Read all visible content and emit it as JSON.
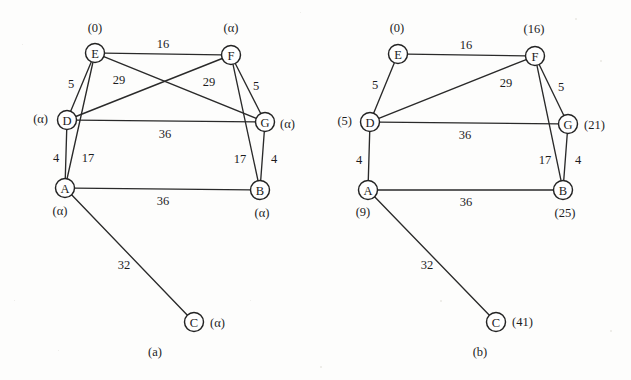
{
  "figure": {
    "type": "graph-diagram",
    "node_radius": 9.5,
    "panels": [
      {
        "id": "panel-a",
        "caption": "(a)",
        "caption_pos": {
          "x": 155,
          "y": 352
        },
        "nodes": [
          {
            "id": "E",
            "label": "E",
            "x": 95,
            "y": 53,
            "dist": "(0)",
            "dist_x": 95,
            "dist_y": 28,
            "dist_anchor": "middle"
          },
          {
            "id": "F",
            "label": "F",
            "x": 231,
            "y": 55,
            "dist": "(α)",
            "dist_x": 231,
            "dist_y": 28,
            "dist_anchor": "middle"
          },
          {
            "id": "D",
            "label": "D",
            "x": 67,
            "y": 120,
            "dist": "(α)",
            "dist_x": 48,
            "dist_y": 119,
            "dist_anchor": "end"
          },
          {
            "id": "G",
            "label": "G",
            "x": 265,
            "y": 122,
            "dist": "(α)",
            "dist_x": 280,
            "dist_y": 124,
            "dist_anchor": "start"
          },
          {
            "id": "A",
            "label": "A",
            "x": 65,
            "y": 188,
            "dist": "(α)",
            "dist_x": 60,
            "dist_y": 211,
            "dist_anchor": "middle"
          },
          {
            "id": "B",
            "label": "B",
            "x": 260,
            "y": 190,
            "dist": "(α)",
            "dist_x": 262,
            "dist_y": 213,
            "dist_anchor": "middle"
          },
          {
            "id": "C",
            "label": "C",
            "x": 194,
            "y": 322,
            "dist": "(α)",
            "dist_x": 210,
            "dist_y": 323,
            "dist_anchor": "start"
          }
        ],
        "edges": [
          {
            "from": "E",
            "to": "F",
            "weight": "16",
            "lx": 163,
            "ly": 44
          },
          {
            "from": "E",
            "to": "D",
            "weight": "5",
            "lx": 71,
            "ly": 84
          },
          {
            "from": "E",
            "to": "G",
            "weight": "29",
            "lx": 119,
            "ly": 80
          },
          {
            "from": "E",
            "to": "A",
            "weight": "17",
            "lx": 88,
            "ly": 158
          },
          {
            "from": "F",
            "to": "D",
            "weight": "29",
            "lx": 209,
            "ly": 82
          },
          {
            "from": "F",
            "to": "G",
            "weight": "5",
            "lx": 256,
            "ly": 86
          },
          {
            "from": "F",
            "to": "B",
            "weight": "17",
            "lx": 240,
            "ly": 159
          },
          {
            "from": "D",
            "to": "G",
            "weight": "36",
            "lx": 165,
            "ly": 134
          },
          {
            "from": "D",
            "to": "A",
            "weight": "4",
            "lx": 56,
            "ly": 158
          },
          {
            "from": "G",
            "to": "B",
            "weight": "4",
            "lx": 274,
            "ly": 159
          },
          {
            "from": "A",
            "to": "B",
            "weight": "36",
            "lx": 163,
            "ly": 201
          },
          {
            "from": "A",
            "to": "C",
            "weight": "32",
            "lx": 124,
            "ly": 265
          }
        ]
      },
      {
        "id": "panel-b",
        "caption": "(b)",
        "caption_pos": {
          "x": 480,
          "y": 352
        },
        "nodes": [
          {
            "id": "E",
            "label": "E",
            "x": 398,
            "y": 54,
            "dist": "(0)",
            "dist_x": 397,
            "dist_y": 28,
            "dist_anchor": "middle"
          },
          {
            "id": "F",
            "label": "F",
            "x": 535,
            "y": 56,
            "dist": "(16)",
            "dist_x": 534,
            "dist_y": 29,
            "dist_anchor": "middle"
          },
          {
            "id": "D",
            "label": "D",
            "x": 370,
            "y": 122,
            "dist": "(5)",
            "dist_x": 352,
            "dist_y": 121,
            "dist_anchor": "end"
          },
          {
            "id": "G",
            "label": "G",
            "x": 568,
            "y": 124,
            "dist": "(21)",
            "dist_x": 584,
            "dist_y": 125,
            "dist_anchor": "start"
          },
          {
            "id": "A",
            "label": "A",
            "x": 368,
            "y": 190,
            "dist": "(9)",
            "dist_x": 363,
            "dist_y": 212,
            "dist_anchor": "middle"
          },
          {
            "id": "B",
            "label": "B",
            "x": 563,
            "y": 190,
            "dist": "(25)",
            "dist_x": 565,
            "dist_y": 213,
            "dist_anchor": "middle"
          },
          {
            "id": "C",
            "label": "C",
            "x": 496,
            "y": 322,
            "dist": "(41)",
            "dist_x": 512,
            "dist_y": 322,
            "dist_anchor": "start"
          }
        ],
        "edges": [
          {
            "from": "E",
            "to": "F",
            "weight": "16",
            "lx": 466,
            "ly": 45
          },
          {
            "from": "E",
            "to": "D",
            "weight": "5",
            "lx": 375,
            "ly": 85
          },
          {
            "from": "F",
            "to": "D",
            "weight": "29",
            "lx": 506,
            "ly": 83
          },
          {
            "from": "F",
            "to": "G",
            "weight": "5",
            "lx": 561,
            "ly": 87
          },
          {
            "from": "F",
            "to": "B",
            "weight": "17",
            "lx": 545,
            "ly": 160
          },
          {
            "from": "D",
            "to": "G",
            "weight": "36",
            "lx": 465,
            "ly": 135
          },
          {
            "from": "D",
            "to": "A",
            "weight": "4",
            "lx": 359,
            "ly": 160
          },
          {
            "from": "G",
            "to": "B",
            "weight": "4",
            "lx": 578,
            "ly": 160
          },
          {
            "from": "A",
            "to": "B",
            "weight": "36",
            "lx": 466,
            "ly": 202
          },
          {
            "from": "A",
            "to": "C",
            "weight": "32",
            "lx": 427,
            "ly": 265
          }
        ]
      }
    ]
  }
}
